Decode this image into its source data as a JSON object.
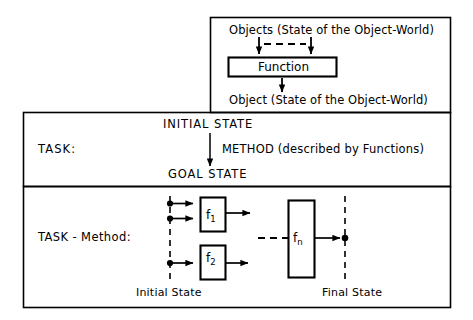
{
  "figure": {
    "type": "block-diagram",
    "title_text": null,
    "background_color": "#ffffff",
    "line_color": "#000000"
  },
  "panels": {
    "function_panel": {
      "name": "function-panel",
      "input_label": "Objects  (State of the Object-World)",
      "process_label": "Function",
      "output_label": "Object  (State of the Object-World)"
    },
    "task_panel": {
      "name": "task-panel",
      "row_label": "TASK:",
      "initial_state": "INITIAL STATE",
      "method_label": "METHOD (described by Functions)",
      "goal_state": "GOAL STATE"
    },
    "task_method_panel": {
      "name": "task-method-panel",
      "row_label": "TASK - Method:",
      "initial_state_axis": "Initial State",
      "final_state_axis": "Final State",
      "functions": [
        {
          "id": "f1",
          "base": "f",
          "sub": "1"
        },
        {
          "id": "f2",
          "base": "f",
          "sub": "2"
        },
        {
          "id": "fn",
          "base": "f",
          "sub": "n"
        }
      ]
    }
  }
}
